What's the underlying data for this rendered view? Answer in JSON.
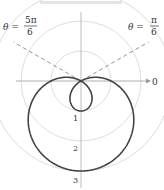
{
  "chart_data": {
    "type": "line",
    "subtype": "polar",
    "title": "",
    "equation": "r = 1 - 2 sin θ",
    "origin_px": [
      81,
      81
    ],
    "scale_px_per_unit": 30,
    "grid_circles": [
      1,
      2,
      3
    ],
    "radial_tick_labels": [
      "1",
      "2",
      "3"
    ],
    "polar_axis_label": "0",
    "annotations": [
      {
        "text": "θ = 5π/6",
        "lhs": "θ =",
        "num": "5π",
        "den": "6",
        "angle_deg": 150,
        "style": "dashed"
      },
      {
        "text": "θ = π/6",
        "lhs": "θ =",
        "num": "π",
        "den": "6",
        "angle_deg": 30,
        "style": "dashed"
      }
    ],
    "series": [
      {
        "name": "limacon",
        "r_of_theta": "1 - 2*sin(theta)",
        "theta_range": [
          0,
          6.2832
        ],
        "color": "#444444"
      }
    ],
    "colors": {
      "curve": "#444444",
      "grid": "#d9d9d9",
      "axis": "#999999",
      "dashed": "#888888"
    }
  }
}
